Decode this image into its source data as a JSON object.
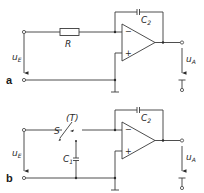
{
  "diagram": {
    "type": "circuit-schematic",
    "panels": [
      {
        "tag": "a",
        "title": "Integrator with resistor input",
        "components": {
          "resistor": {
            "label": "R"
          },
          "feedback_capacitor": {
            "label": "C",
            "sub": "2"
          },
          "opamp": {
            "minus": "−",
            "plus": "+"
          }
        },
        "input_voltage": {
          "label": "u",
          "sub": "E"
        },
        "output_voltage": {
          "label": "u",
          "sub": "A"
        }
      },
      {
        "tag": "b",
        "title": "Switched-capacitor integrator",
        "components": {
          "switch": {
            "label": "S",
            "annotation": "(T)"
          },
          "input_capacitor": {
            "label": "C",
            "sub": "1"
          },
          "feedback_capacitor": {
            "label": "C",
            "sub": "2"
          },
          "opamp": {
            "minus": "−",
            "plus": "+"
          }
        },
        "input_voltage": {
          "label": "u",
          "sub": "E"
        },
        "output_voltage": {
          "label": "u",
          "sub": "A"
        }
      }
    ],
    "colors": {
      "line": "#3a3a3a",
      "background": "#ffffff"
    }
  }
}
